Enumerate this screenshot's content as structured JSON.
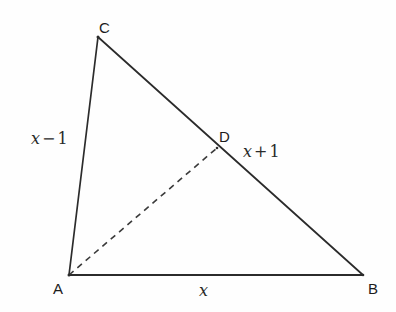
{
  "figure": {
    "background_color": "#fefefe",
    "stroke_color": "#2b2b2b",
    "width": 396,
    "height": 312
  },
  "vertices": {
    "A": {
      "label": "A",
      "x": 69,
      "y": 275,
      "label_x": 53,
      "label_y": 281
    },
    "B": {
      "label": "B",
      "x": 363,
      "y": 275,
      "label_x": 368,
      "label_y": 281
    },
    "C": {
      "label": "C",
      "x": 98,
      "y": 37,
      "label_x": 99,
      "label_y": 20
    },
    "D": {
      "label": "D",
      "x": 217,
      "y": 148,
      "label_x": 219,
      "label_y": 129
    }
  },
  "edges": {
    "AC": {
      "name": "side-AC",
      "from": "A",
      "to": "C",
      "style": "solid"
    },
    "CB": {
      "name": "side-CB",
      "from": "C",
      "to": "B",
      "style": "solid"
    },
    "AB": {
      "name": "side-AB",
      "from": "A",
      "to": "B",
      "style": "solid"
    },
    "AD": {
      "name": "cevian-AD",
      "from": "A",
      "to": "D",
      "style": "dashed",
      "dash_pattern": "6 5"
    }
  },
  "measure_labels": {
    "ac": {
      "name": "length-label-ac",
      "var": "x",
      "op": "−",
      "num": "1",
      "full": "x − 1",
      "x": 31,
      "y": 131
    },
    "db": {
      "name": "length-label-db",
      "var": "x",
      "op": "+",
      "num": "1",
      "full": "x + 1",
      "x": 243,
      "y": 144
    },
    "ab": {
      "name": "length-label-ab",
      "var": "x",
      "op": "",
      "num": "",
      "full": "x",
      "x": 199,
      "y": 283
    }
  }
}
